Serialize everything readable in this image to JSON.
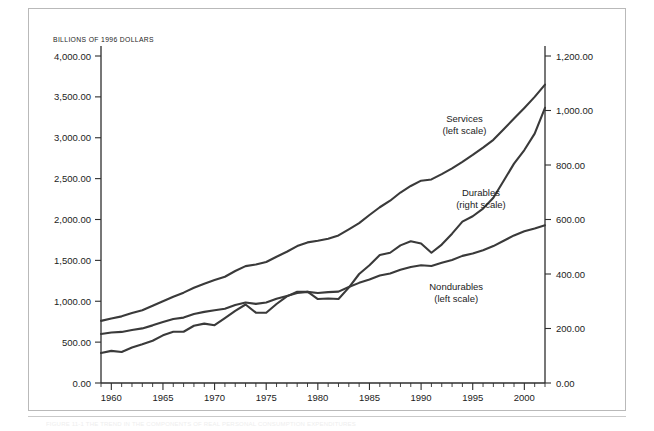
{
  "figure": {
    "units_label": "BILLIONS OF 1996 DOLLARS",
    "caption": "FIGURE 11-1   THE TREND IN THE COMPONENTS OF REAL PERSONAL CONSUMPTION EXPENDITURES",
    "line_color": "#3a3a3a",
    "axis_color": "#2e2e2e",
    "frame_color": "#b9b9b9",
    "background": "#ffffff"
  },
  "annotations": [
    {
      "name": "services",
      "line1": "Services",
      "line2": "(left scale)",
      "x": 1994.2,
      "y_px": 122
    },
    {
      "name": "durables",
      "line1": "Durables",
      "line2": "(right scale)",
      "x": 1995.8,
      "y_px": 196
    },
    {
      "name": "nondurables",
      "line1": "Nondurables",
      "line2": "(left scale)",
      "x": 1993.4,
      "y_px": 290
    }
  ],
  "chart_data": {
    "type": "line",
    "title": "",
    "subtitle": "",
    "xlabel": "",
    "ylabel": "BILLIONS OF 1996 DOLLARS",
    "ylabel_right": "",
    "grid": false,
    "legend": "inline-annotations",
    "xlim": [
      1959,
      2002
    ],
    "x_ticks": [
      1960,
      1965,
      1970,
      1975,
      1980,
      1985,
      1990,
      1995,
      2000
    ],
    "x_tick_labels": [
      "1960",
      "1965",
      "1970",
      "1975",
      "1980",
      "1985",
      "1990",
      "1995",
      "2000"
    ],
    "x_minor_step": 1,
    "ylim": [
      0,
      4000
    ],
    "y_ticks": [
      0,
      500,
      1000,
      1500,
      2000,
      2500,
      3000,
      3500,
      4000
    ],
    "y_tick_labels": [
      "0.00",
      "500.00",
      "1,000.00",
      "1,500.00",
      "2,000.00",
      "2,500.00",
      "3,000.00",
      "3,500.00",
      "4,000.00"
    ],
    "ylim_right": [
      0,
      1200
    ],
    "y_ticks_right": [
      0,
      200,
      400,
      600,
      800,
      1000,
      1200
    ],
    "y_tick_labels_right": [
      "0.00",
      "200.00",
      "400.00",
      "600.00",
      "800.00",
      "1,000.00",
      "1,200.00"
    ],
    "x": [
      1959,
      1960,
      1961,
      1962,
      1963,
      1964,
      1965,
      1966,
      1967,
      1968,
      1969,
      1970,
      1971,
      1972,
      1973,
      1974,
      1975,
      1976,
      1977,
      1978,
      1979,
      1980,
      1981,
      1982,
      1983,
      1984,
      1985,
      1986,
      1987,
      1988,
      1989,
      1990,
      1991,
      1992,
      1993,
      1994,
      1995,
      1996,
      1997,
      1998,
      1999,
      2000,
      2001,
      2002
    ],
    "series": [
      {
        "name": "Services",
        "axis": "left",
        "units": "Billions of 1996 dollars",
        "values": [
          760,
          790,
          815,
          855,
          890,
          945,
          1000,
          1055,
          1105,
          1165,
          1215,
          1260,
          1300,
          1370,
          1430,
          1450,
          1480,
          1545,
          1605,
          1675,
          1720,
          1740,
          1765,
          1805,
          1880,
          1955,
          2055,
          2150,
          2230,
          2330,
          2410,
          2475,
          2490,
          2555,
          2625,
          2705,
          2790,
          2880,
          2975,
          3105,
          3235,
          3365,
          3500,
          3650
        ]
      },
      {
        "name": "Durables",
        "axis": "right",
        "units": "Billions of 1996 dollars",
        "values": [
          110,
          118,
          114,
          130,
          142,
          155,
          175,
          188,
          188,
          210,
          218,
          212,
          238,
          265,
          288,
          258,
          258,
          290,
          318,
          335,
          335,
          308,
          310,
          308,
          350,
          400,
          432,
          470,
          478,
          505,
          520,
          512,
          478,
          508,
          548,
          592,
          612,
          640,
          680,
          742,
          805,
          855,
          915,
          1010
        ]
      },
      {
        "name": "Nondurables",
        "axis": "left",
        "units": "Billions of 1996 dollars",
        "values": [
          600,
          618,
          625,
          648,
          668,
          705,
          745,
          782,
          800,
          845,
          870,
          890,
          908,
          955,
          985,
          968,
          985,
          1030,
          1065,
          1100,
          1115,
          1100,
          1112,
          1118,
          1175,
          1225,
          1265,
          1315,
          1340,
          1385,
          1420,
          1440,
          1432,
          1470,
          1505,
          1555,
          1585,
          1625,
          1675,
          1740,
          1805,
          1855,
          1890,
          1930
        ]
      }
    ]
  }
}
